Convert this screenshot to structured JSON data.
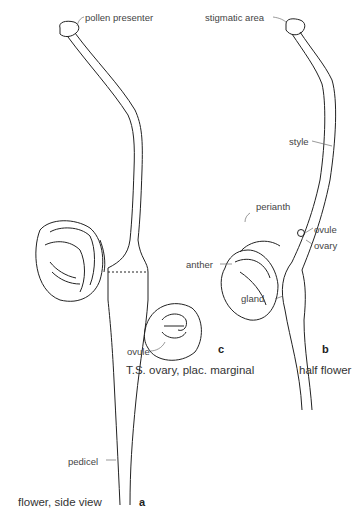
{
  "figure": {
    "panels": [
      {
        "id": "a",
        "letter": "a",
        "caption": "flower, side view",
        "labels": {
          "pollen_presenter": "pollen presenter",
          "pedicel": "pedicel"
        }
      },
      {
        "id": "b",
        "letter": "b",
        "caption": "half flower",
        "labels": {
          "stigmatic_area": "stigmatic area",
          "style": "style",
          "perianth": "perianth",
          "ovule": "ovule",
          "ovary": "ovary",
          "anther": "anther",
          "gland": "gland"
        }
      },
      {
        "id": "c",
        "letter": "c",
        "caption": "T.S. ovary, plac. marginal",
        "labels": {
          "ovule": "ovule"
        }
      }
    ]
  }
}
